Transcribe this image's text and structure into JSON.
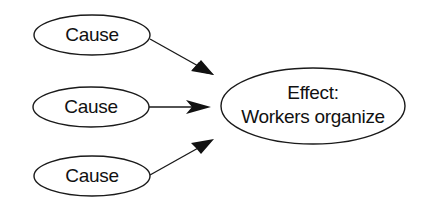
{
  "diagram": {
    "type": "cause-effect",
    "nodes": [
      {
        "id": "cause1",
        "role": "cause",
        "label": "Cause",
        "cx": 92,
        "cy": 35,
        "rx": 58,
        "ry": 20
      },
      {
        "id": "cause2",
        "role": "cause",
        "label": "Cause",
        "cx": 91,
        "cy": 107,
        "rx": 58,
        "ry": 20
      },
      {
        "id": "cause3",
        "role": "cause",
        "label": "Cause",
        "cx": 92,
        "cy": 176,
        "rx": 58,
        "ry": 20
      }
    ],
    "effect": {
      "id": "effect",
      "role": "effect",
      "line1": "Effect:",
      "line2": "Workers organize",
      "cx": 313,
      "cy": 106,
      "rx": 92,
      "ry": 38
    },
    "edges": [
      {
        "from": "cause1",
        "to": "effect"
      },
      {
        "from": "cause2",
        "to": "effect"
      },
      {
        "from": "cause3",
        "to": "effect"
      }
    ],
    "colors": {
      "stroke": "#1a1a1a",
      "fill": "#ffffff",
      "text": "#111111",
      "background": "#ffffff"
    }
  }
}
